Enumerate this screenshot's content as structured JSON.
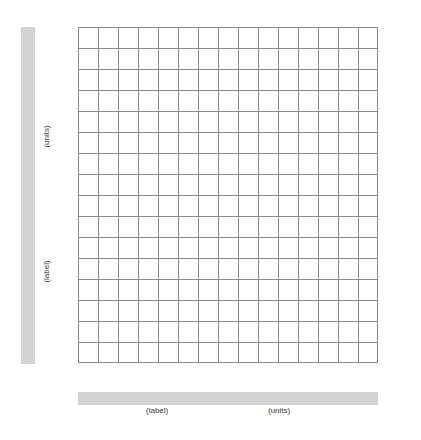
{
  "figure": {
    "title": "",
    "background_color": "#ffffff",
    "band_color": "#d3d3d3",
    "grid_line_color": "#8a8a8a",
    "grid_border_color": "#8a8a8a",
    "text_color": "#3a3a3a"
  },
  "y_axis": {
    "band_label": "y-axis-band",
    "units_text": "(units)",
    "label_text": "(label)",
    "orientation": "vertical",
    "rotation_degrees": -90
  },
  "x_axis": {
    "band_label": "x-axis-band",
    "label_text": "(label)",
    "units_text": "(units)",
    "orientation": "horizontal",
    "rotation_degrees": 0
  },
  "chart_data": {
    "type": "table",
    "title": "",
    "subtitle": "",
    "xlabel": "(label) (units)",
    "ylabel": "(label) (units)",
    "grid": true,
    "legend": null,
    "legend_position": "none",
    "series": [],
    "x": [],
    "values": [],
    "categories": [],
    "annotations": [],
    "grid_columns": 15,
    "grid_rows": 16,
    "cell_width_px": 20,
    "cell_height_px": 21,
    "xlim": [
      0,
      15
    ],
    "ylim": [
      0,
      16
    ],
    "xticks": [
      0,
      1,
      2,
      3,
      4,
      5,
      6,
      7,
      8,
      9,
      10,
      11,
      12,
      13,
      14,
      15
    ],
    "yticks": [
      0,
      1,
      2,
      3,
      4,
      5,
      6,
      7,
      8,
      9,
      10,
      11,
      12,
      13,
      14,
      15,
      16
    ],
    "xtick_labels": [],
    "ytick_labels": []
  }
}
